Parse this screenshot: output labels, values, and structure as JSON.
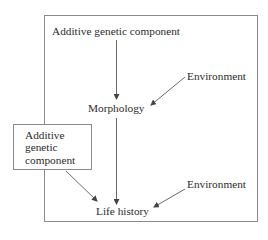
{
  "diagram": {
    "type": "path-diagram",
    "nodes": {
      "genetic_top": "Additive genetic component",
      "environment_top": "Environment",
      "morphology": "Morphology",
      "genetic_boxed": [
        "Additive",
        "genetic",
        "component"
      ],
      "environment_bottom": "Environment",
      "life_history": "Life history"
    },
    "edges": [
      {
        "from": "Additive genetic component",
        "to": "Morphology"
      },
      {
        "from": "Environment",
        "to": "Morphology"
      },
      {
        "from": "Morphology",
        "to": "Life history"
      },
      {
        "from": "Additive genetic component (boxed)",
        "to": "Life history"
      },
      {
        "from": "Environment",
        "to": "Life history"
      }
    ],
    "colors": {
      "line": "#6a6a6a",
      "box_border": "#8a8a8a",
      "text": "#2b2b2b"
    }
  }
}
